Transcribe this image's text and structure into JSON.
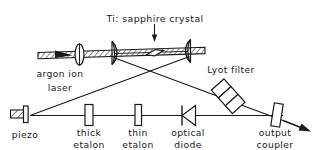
{
  "figure": {
    "type": "optical-schematic",
    "stroke_color": "#1a1a1a",
    "fill_color": "#ffffff",
    "background": "#ffffff"
  },
  "labels": {
    "crystal": "Ti: sapphire crystal",
    "pump_line1": "argon ion",
    "pump_line2": "laser",
    "lyot": "Lyot filter",
    "piezo": "piezo",
    "thick_etalon_line1": "thick",
    "thick_etalon_line2": "etalon",
    "thin_etalon_line1": "thin",
    "thin_etalon_line2": "etalon",
    "optical_diode_line1": "optical",
    "optical_diode_line2": "diode",
    "output_coupler_line1": "output",
    "output_coupler_line2": "coupler"
  },
  "components": [
    {
      "name": "crystal",
      "kind": "brewster-cut-rod",
      "label": "Ti: sapphire crystal"
    },
    {
      "name": "pump-beam",
      "kind": "hatched-beam",
      "label": "argon ion laser"
    },
    {
      "name": "focusing-lens",
      "kind": "lens",
      "label": ""
    },
    {
      "name": "folding-mirror-left",
      "kind": "concave-mirror",
      "label": ""
    },
    {
      "name": "folding-mirror-right",
      "kind": "concave-mirror",
      "label": ""
    },
    {
      "name": "lyot-filter",
      "kind": "birefringent-plate-stack",
      "label": "Lyot filter"
    },
    {
      "name": "piezo-mirror",
      "kind": "piezo-mounted-mirror",
      "label": "piezo"
    },
    {
      "name": "thick-etalon",
      "kind": "etalon",
      "label": "thick etalon"
    },
    {
      "name": "thin-etalon",
      "kind": "etalon",
      "label": "thin etalon"
    },
    {
      "name": "optical-diode",
      "kind": "diode-symbol",
      "label": "optical diode"
    },
    {
      "name": "output-coupler",
      "kind": "partial-mirror",
      "label": "output coupler"
    },
    {
      "name": "output-beam",
      "kind": "arrow",
      "label": ""
    }
  ],
  "annotations": {
    "crystal_pointer": "down-arrow",
    "pump_direction": "right",
    "output_direction": "down-right"
  }
}
